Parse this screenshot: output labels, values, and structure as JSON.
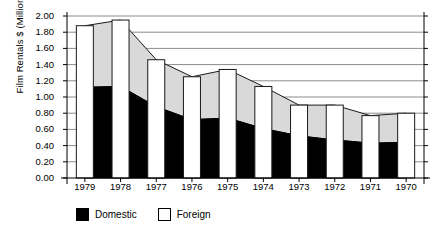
{
  "chart_data": {
    "type": "area",
    "title": "",
    "xlabel": "",
    "ylabel": "Film Rentals $ (Millions)",
    "categories": [
      "1979",
      "1978",
      "1977",
      "1976",
      "1975",
      "1974",
      "1973",
      "1972",
      "1971",
      "1970"
    ],
    "ylim": [
      0.0,
      2.0
    ],
    "ytick_labels": [
      "2.00",
      "1.80",
      "1.60",
      "1.40",
      "1.20",
      "1.00",
      "0.80",
      "0.60",
      "0.40",
      "0.20",
      "0.00"
    ],
    "ytick_values": [
      2.0,
      1.8,
      1.6,
      1.4,
      1.2,
      1.0,
      0.8,
      0.6,
      0.4,
      0.2,
      0.0
    ],
    "grid": true,
    "legend_position": "bottom-left",
    "stacked": true,
    "series": [
      {
        "name": "Domestic",
        "color": "#000000",
        "values": [
          1.12,
          1.13,
          0.88,
          0.72,
          0.74,
          0.61,
          0.52,
          0.47,
          0.43,
          0.44
        ]
      },
      {
        "name": "Foreign",
        "color": "#d9d9d9",
        "values": [
          0.76,
          0.82,
          0.58,
          0.53,
          0.6,
          0.52,
          0.38,
          0.43,
          0.34,
          0.36
        ]
      }
    ],
    "totals": [
      1.88,
      1.95,
      1.46,
      1.25,
      1.34,
      1.13,
      0.9,
      0.9,
      0.77,
      0.8
    ]
  },
  "legend": {
    "domestic_label": "Domestic",
    "foreign_label": "Foreign",
    "domestic_swatch": "domestic-swatch",
    "foreign_swatch": "foreign-swatch"
  }
}
